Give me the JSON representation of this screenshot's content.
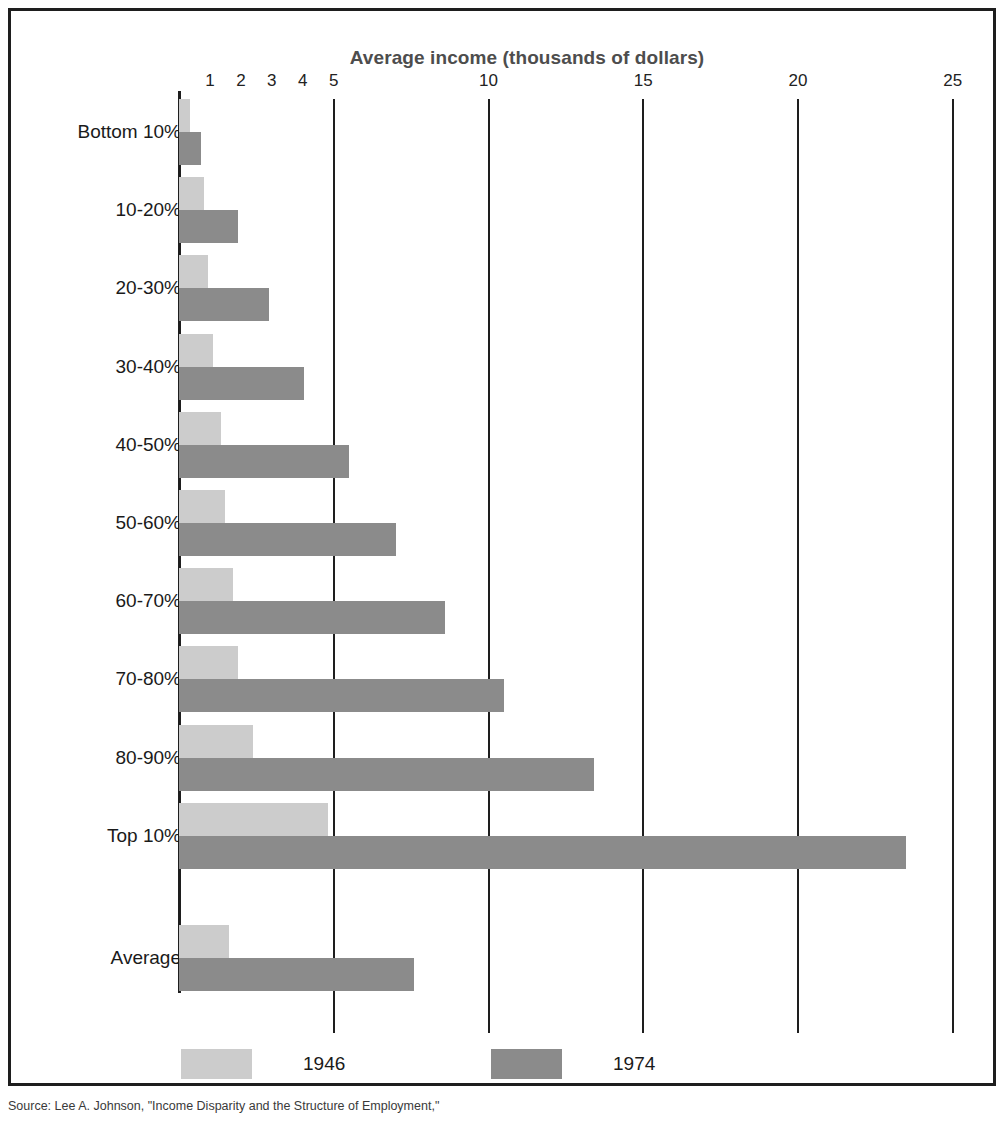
{
  "chart_data": {
    "type": "bar",
    "orientation": "horizontal",
    "title": "Average income (thousands of dollars)",
    "xlabel": "Average income (thousands of dollars)",
    "ylabel": "",
    "xlim": [
      0,
      26.5
    ],
    "grid": true,
    "gridlines_at": [
      5,
      10,
      15,
      20,
      25
    ],
    "xticks": [
      1,
      2,
      3,
      4,
      5,
      10,
      15,
      20,
      25
    ],
    "xtick_labels": [
      "1",
      "2",
      "3",
      "4",
      "5",
      "10",
      "15",
      "20",
      "25"
    ],
    "tick_label_position": "top",
    "legend_position": "bottom",
    "categories": [
      "Bottom 10%",
      "10-20%",
      "20-30%",
      "30-40%",
      "40-50%",
      "50-60%",
      "60-70%",
      "70-80%",
      "80-90%",
      "Top 10%",
      "Average"
    ],
    "series": [
      {
        "name": "1946",
        "color": "#cccccc",
        "values": [
          0.35,
          0.8,
          0.95,
          1.1,
          1.35,
          1.5,
          1.75,
          1.9,
          2.4,
          4.8,
          1.6
        ]
      },
      {
        "name": "1974",
        "color": "#8b8b8b",
        "values": [
          0.7,
          1.9,
          2.9,
          4.05,
          5.5,
          7.0,
          8.6,
          10.5,
          13.4,
          23.5,
          7.6
        ]
      }
    ]
  },
  "legend": {
    "items": [
      {
        "label": "1946",
        "color": "#cccccc"
      },
      {
        "label": "1974",
        "color": "#8b8b8b"
      }
    ]
  },
  "source_note": "Source: Lee A. Johnson, \"Income Disparity and the Structure of Employment,\"",
  "colors": {
    "series_1946": "#cccccc",
    "series_1974": "#8b8b8b",
    "axis": "#1e1e1e",
    "title": "#4d4d4d",
    "background": "#ffffff"
  }
}
